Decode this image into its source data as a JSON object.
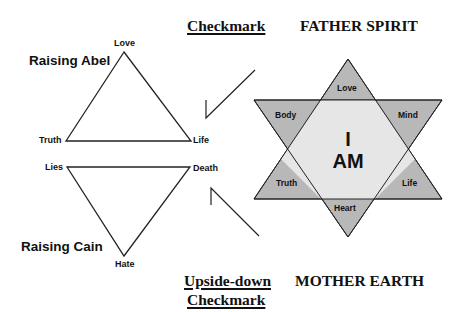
{
  "headings": {
    "checkmark": "Checkmark",
    "father_spirit": "FATHER SPIRIT",
    "upside_down_line1": "Upside-down",
    "upside_down_line2": "Checkmark",
    "mother_earth": "MOTHER EARTH"
  },
  "upper_triangle": {
    "title": "Raising Abel",
    "apex": "Love",
    "left": "Truth",
    "right": "Life"
  },
  "lower_triangle": {
    "title": "Raising Cain",
    "apex": "Hate",
    "left": "Lies",
    "right": "Death"
  },
  "star": {
    "center_line1": "I",
    "center_line2": "AM",
    "points": {
      "top": "Love",
      "upper_left": "Body",
      "upper_right": "Mind",
      "lower_left": "Truth",
      "lower_right": "Life",
      "bottom": "Heart"
    },
    "colors": {
      "point_fill": "#b8b8b8",
      "center_fill": "#e6e6e6",
      "stroke": "#222222"
    }
  }
}
